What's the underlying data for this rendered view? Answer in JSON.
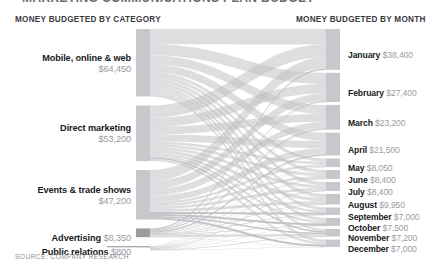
{
  "title": "MARKETING COMMUNICATIONS PLAN BUDGET",
  "headers": {
    "left": "MONEY BUDGETED BY CATEGORY",
    "right": "MONEY BUDGETED BY MONTH"
  },
  "source": "SOURCE: COMPANY RESEARCH",
  "categories": [
    {
      "label": "Mobile, online & web",
      "value": "$64,450",
      "amount": 64450
    },
    {
      "label": "Direct marketing",
      "value": "$53,200",
      "amount": 53200
    },
    {
      "label": "Events & trade shows",
      "value": "$47,200",
      "amount": 47200
    },
    {
      "label": "Advertising",
      "value": "$8,350",
      "amount": 8350
    },
    {
      "label": "Public relations",
      "value": "$800",
      "amount": 800
    }
  ],
  "months": [
    {
      "label": "January",
      "value": "$38,400",
      "amount": 38400
    },
    {
      "label": "February",
      "value": "$27,400",
      "amount": 27400
    },
    {
      "label": "March",
      "value": "$23,200",
      "amount": 23200
    },
    {
      "label": "April",
      "value": "$21,500",
      "amount": 21500
    },
    {
      "label": "May",
      "value": "$8,050",
      "amount": 8050
    },
    {
      "label": "June",
      "value": "$8,400",
      "amount": 8400
    },
    {
      "label": "July",
      "value": "$8,400",
      "amount": 8400
    },
    {
      "label": "August",
      "value": "$9,950",
      "amount": 9950
    },
    {
      "label": "September",
      "value": "$7,000",
      "amount": 7000
    },
    {
      "label": "October",
      "value": "$7,500",
      "amount": 7500
    },
    {
      "label": "November",
      "value": "$7,200",
      "amount": 7200
    },
    {
      "label": "December",
      "value": "$7,000",
      "amount": 7000
    }
  ],
  "colors": {
    "node": "#c8c8cc",
    "node_dark": "#9a9aa0",
    "link": "#bfbfc4",
    "label_name": "#1a1a1c",
    "label_value": "#9b9ba2",
    "header": "#3b3b3f",
    "source": "#8e8e95",
    "background": "#ffffff"
  },
  "chart_data": {
    "type": "sankey",
    "title": "MARKETING COMMUNICATIONS PLAN BUDGET",
    "xlabel": "",
    "ylabel": "",
    "grid": false,
    "legend": "none",
    "units": "USD",
    "total": 174000,
    "nodes_left": [
      {
        "name": "Mobile, online & web",
        "value": 64450
      },
      {
        "name": "Direct marketing",
        "value": 53200
      },
      {
        "name": "Events & trade shows",
        "value": 47200
      },
      {
        "name": "Advertising",
        "value": 8350
      },
      {
        "name": "Public relations",
        "value": 800
      }
    ],
    "nodes_right": [
      {
        "name": "January",
        "value": 38400
      },
      {
        "name": "February",
        "value": 27400
      },
      {
        "name": "March",
        "value": 23200
      },
      {
        "name": "April",
        "value": 21500
      },
      {
        "name": "May",
        "value": 8050
      },
      {
        "name": "June",
        "value": 8400
      },
      {
        "name": "July",
        "value": 8400
      },
      {
        "name": "August",
        "value": 9950
      },
      {
        "name": "September",
        "value": 7000
      },
      {
        "name": "October",
        "value": 7500
      },
      {
        "name": "November",
        "value": 7200
      },
      {
        "name": "December",
        "value": 7000
      }
    ],
    "links": [
      {
        "source": "Mobile, online & web",
        "target": "January",
        "value": 14500
      },
      {
        "source": "Mobile, online & web",
        "target": "February",
        "value": 10500
      },
      {
        "source": "Mobile, online & web",
        "target": "March",
        "value": 8600
      },
      {
        "source": "Mobile, online & web",
        "target": "April",
        "value": 7800
      },
      {
        "source": "Mobile, online & web",
        "target": "May",
        "value": 3000
      },
      {
        "source": "Mobile, online & web",
        "target": "June",
        "value": 3100
      },
      {
        "source": "Mobile, online & web",
        "target": "July",
        "value": 3100
      },
      {
        "source": "Mobile, online & web",
        "target": "August",
        "value": 3700
      },
      {
        "source": "Mobile, online & web",
        "target": "September",
        "value": 2600
      },
      {
        "source": "Mobile, online & web",
        "target": "October",
        "value": 2800
      },
      {
        "source": "Mobile, online & web",
        "target": "November",
        "value": 2150
      },
      {
        "source": "Mobile, online & web",
        "target": "December",
        "value": 2600
      },
      {
        "source": "Direct marketing",
        "target": "January",
        "value": 12000
      },
      {
        "source": "Direct marketing",
        "target": "February",
        "value": 8600
      },
      {
        "source": "Direct marketing",
        "target": "March",
        "value": 7200
      },
      {
        "source": "Direct marketing",
        "target": "April",
        "value": 6600
      },
      {
        "source": "Direct marketing",
        "target": "May",
        "value": 2500
      },
      {
        "source": "Direct marketing",
        "target": "June",
        "value": 2600
      },
      {
        "source": "Direct marketing",
        "target": "July",
        "value": 2600
      },
      {
        "source": "Direct marketing",
        "target": "August",
        "value": 3100
      },
      {
        "source": "Direct marketing",
        "target": "September",
        "value": 2150
      },
      {
        "source": "Direct marketing",
        "target": "October",
        "value": 2300
      },
      {
        "source": "Direct marketing",
        "target": "November",
        "value": 1400
      },
      {
        "source": "Direct marketing",
        "target": "December",
        "value": 2150
      },
      {
        "source": "Events & trade shows",
        "target": "January",
        "value": 10600
      },
      {
        "source": "Events & trade shows",
        "target": "February",
        "value": 7600
      },
      {
        "source": "Events & trade shows",
        "target": "March",
        "value": 6400
      },
      {
        "source": "Events & trade shows",
        "target": "April",
        "value": 5900
      },
      {
        "source": "Events & trade shows",
        "target": "May",
        "value": 2200
      },
      {
        "source": "Events & trade shows",
        "target": "June",
        "value": 2300
      },
      {
        "source": "Events & trade shows",
        "target": "July",
        "value": 2300
      },
      {
        "source": "Events & trade shows",
        "target": "August",
        "value": 2700
      },
      {
        "source": "Events & trade shows",
        "target": "September",
        "value": 1900
      },
      {
        "source": "Events & trade shows",
        "target": "October",
        "value": 2050
      },
      {
        "source": "Events & trade shows",
        "target": "November",
        "value": 1350
      },
      {
        "source": "Events & trade shows",
        "target": "December",
        "value": 1900
      },
      {
        "source": "Advertising",
        "target": "January",
        "value": 1250
      },
      {
        "source": "Advertising",
        "target": "February",
        "value": 650
      },
      {
        "source": "Advertising",
        "target": "March",
        "value": 900
      },
      {
        "source": "Advertising",
        "target": "April",
        "value": 1100
      },
      {
        "source": "Advertising",
        "target": "May",
        "value": 320
      },
      {
        "source": "Advertising",
        "target": "June",
        "value": 370
      },
      {
        "source": "Advertising",
        "target": "July",
        "value": 370
      },
      {
        "source": "Advertising",
        "target": "August",
        "value": 420
      },
      {
        "source": "Advertising",
        "target": "September",
        "value": 330
      },
      {
        "source": "Advertising",
        "target": "October",
        "value": 330
      },
      {
        "source": "Advertising",
        "target": "November",
        "value": 2280
      },
      {
        "source": "Advertising",
        "target": "December",
        "value": 330
      },
      {
        "source": "Public relations",
        "target": "January",
        "value": 50
      },
      {
        "source": "Public relations",
        "target": "February",
        "value": 50
      },
      {
        "source": "Public relations",
        "target": "March",
        "value": 100
      },
      {
        "source": "Public relations",
        "target": "April",
        "value": 100
      },
      {
        "source": "Public relations",
        "target": "May",
        "value": 30
      },
      {
        "source": "Public relations",
        "target": "June",
        "value": 30
      },
      {
        "source": "Public relations",
        "target": "July",
        "value": 30
      },
      {
        "source": "Public relations",
        "target": "August",
        "value": 30
      },
      {
        "source": "Public relations",
        "target": "September",
        "value": 20
      },
      {
        "source": "Public relations",
        "target": "October",
        "value": 20
      },
      {
        "source": "Public relations",
        "target": "November",
        "value": 20
      },
      {
        "source": "Public relations",
        "target": "December",
        "value": 20
      }
    ],
    "layout": {
      "left_node_x": 136,
      "left_node_width": 14,
      "right_node_x": 326,
      "right_node_width": 14,
      "top": 29,
      "bottom": 247
    }
  }
}
